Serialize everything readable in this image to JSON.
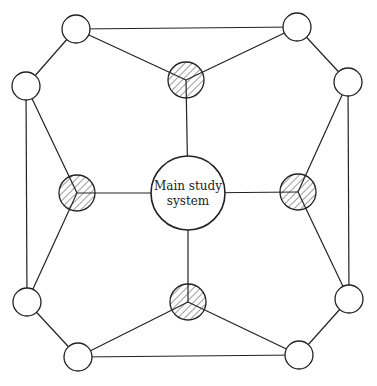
{
  "diagram": {
    "central": {
      "line1": "Main study",
      "line2": "system",
      "cx": 188,
      "cy": 193,
      "r": 37
    },
    "hatched_nodes": [
      {
        "id": "h-top",
        "cx": 186,
        "cy": 80,
        "r": 18
      },
      {
        "id": "h-left",
        "cx": 77,
        "cy": 193,
        "r": 18
      },
      {
        "id": "h-right",
        "cx": 298,
        "cy": 192,
        "r": 18
      },
      {
        "id": "h-bottom",
        "cx": 188,
        "cy": 302,
        "r": 18
      }
    ],
    "outer_nodes": [
      {
        "id": "o-tl",
        "cx": 76,
        "cy": 29,
        "r": 14
      },
      {
        "id": "o-tr",
        "cx": 297,
        "cy": 27,
        "r": 14
      },
      {
        "id": "o-rt",
        "cx": 348,
        "cy": 82,
        "r": 14
      },
      {
        "id": "o-rb",
        "cx": 349,
        "cy": 299,
        "r": 14
      },
      {
        "id": "o-br",
        "cx": 299,
        "cy": 355,
        "r": 14
      },
      {
        "id": "o-bl",
        "cx": 78,
        "cy": 357,
        "r": 14
      },
      {
        "id": "o-lb",
        "cx": 27,
        "cy": 302,
        "r": 14
      },
      {
        "id": "o-lt",
        "cx": 26,
        "cy": 86,
        "r": 14
      }
    ],
    "stroke_color": "#222222"
  }
}
